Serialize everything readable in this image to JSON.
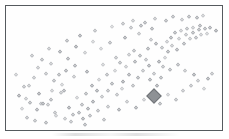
{
  "figure": {
    "title": "",
    "background_color": "#ffffff",
    "frame_color": "#555a5e",
    "marker_color": "#9b9ea3",
    "highlight_marker_color": "#8e9195"
  },
  "chart_data": {
    "type": "scatter",
    "title": "",
    "xlabel": "",
    "ylabel": "",
    "xlim": [
      0,
      100
    ],
    "ylim": [
      0,
      100
    ],
    "grid": false,
    "legend": null,
    "tick_labels": {
      "x": [],
      "y": []
    },
    "annotations": [],
    "series": [
      {
        "name": "observations",
        "marker": "diamond",
        "marker_style": "open",
        "color": "#9b9ea3",
        "points": [
          [
            13.3,
            50.0
          ],
          [
            9.0,
            34.1
          ],
          [
            17.5,
            45.2
          ],
          [
            23.4,
            43.7
          ],
          [
            21.3,
            38.9
          ],
          [
            26.8,
            47.6
          ],
          [
            24.6,
            28.6
          ],
          [
            31.2,
            51.6
          ],
          [
            7.8,
            23.0
          ],
          [
            14.7,
            19.0
          ],
          [
            16.0,
            19.0
          ],
          [
            18.4,
            18.3
          ],
          [
            19.5,
            22.2
          ],
          [
            12.9,
            13.5
          ],
          [
            25.9,
            30.2
          ],
          [
            28.6,
            15.9
          ],
          [
            32.1,
            23.8
          ],
          [
            34.4,
            18.3
          ],
          [
            22.3,
            8.7
          ],
          [
            26.4,
            6.3
          ],
          [
            30.2,
            9.5
          ],
          [
            33.1,
            11.1
          ],
          [
            35.2,
            6.3
          ],
          [
            37.6,
            14.3
          ],
          [
            40.1,
            20.6
          ],
          [
            36.4,
            27.8
          ],
          [
            39.2,
            34.9
          ],
          [
            41.7,
            30.2
          ],
          [
            44.3,
            25.4
          ],
          [
            43.0,
            39.7
          ],
          [
            46.5,
            44.4
          ],
          [
            49.1,
            36.5
          ],
          [
            47.3,
            30.2
          ],
          [
            51.2,
            27.0
          ],
          [
            53.8,
            31.7
          ],
          [
            50.4,
            47.6
          ],
          [
            52.9,
            54.0
          ],
          [
            55.6,
            50.8
          ],
          [
            57.4,
            43.7
          ],
          [
            54.5,
            38.1
          ],
          [
            58.9,
            34.1
          ],
          [
            61.3,
            41.3
          ],
          [
            63.8,
            47.6
          ],
          [
            60.1,
            55.6
          ],
          [
            62.5,
            60.3
          ],
          [
            65.2,
            57.1
          ],
          [
            59.5,
            64.3
          ],
          [
            57.0,
            61.1
          ],
          [
            66.8,
            51.6
          ],
          [
            69.4,
            45.2
          ],
          [
            67.1,
            39.7
          ],
          [
            70.6,
            34.9
          ],
          [
            72.8,
            41.3
          ],
          [
            71.4,
            54.8
          ],
          [
            74.3,
            58.7
          ],
          [
            76.1,
            63.5
          ],
          [
            73.2,
            67.5
          ],
          [
            70.2,
            70.6
          ],
          [
            67.9,
            73.8
          ],
          [
            75.4,
            72.2
          ],
          [
            78.0,
            69.0
          ],
          [
            80.3,
            65.1
          ],
          [
            77.6,
            76.2
          ],
          [
            81.1,
            74.6
          ],
          [
            83.5,
            70.6
          ],
          [
            79.1,
            80.2
          ],
          [
            82.3,
            81.7
          ],
          [
            84.8,
            78.6
          ],
          [
            86.4,
            74.6
          ],
          [
            85.1,
            83.3
          ],
          [
            87.9,
            80.2
          ],
          [
            89.3,
            76.2
          ],
          [
            88.1,
            84.9
          ],
          [
            90.7,
            82.5
          ],
          [
            92.0,
            78.6
          ],
          [
            91.2,
            86.5
          ],
          [
            93.6,
            83.3
          ],
          [
            94.9,
            79.4
          ],
          [
            96.2,
            84.1
          ],
          [
            98.8,
            81.7
          ],
          [
            5.9,
            14.3
          ],
          [
            4.1,
            26.2
          ],
          [
            6.8,
            33.3
          ],
          [
            11.5,
            41.3
          ],
          [
            19.9,
            53.2
          ],
          [
            28.1,
            57.9
          ],
          [
            35.9,
            62.7
          ],
          [
            43.6,
            66.7
          ],
          [
            48.2,
            71.4
          ],
          [
            55.1,
            76.2
          ],
          [
            61.9,
            79.4
          ],
          [
            68.5,
            83.3
          ],
          [
            8.4,
            7.1
          ],
          [
            12.1,
            4.0
          ],
          [
            17.2,
            2.4
          ],
          [
            21.8,
            11.1
          ],
          [
            29.4,
            3.2
          ],
          [
            38.5,
            8.7
          ],
          [
            45.0,
            4.8
          ],
          [
            42.1,
            12.7
          ],
          [
            46.9,
            16.7
          ],
          [
            52.2,
            13.5
          ],
          [
            56.3,
            20.6
          ],
          [
            60.8,
            15.9
          ],
          [
            64.4,
            22.2
          ],
          [
            68.1,
            26.2
          ],
          [
            72.0,
            19.0
          ],
          [
            75.9,
            27.0
          ],
          [
            79.8,
            22.2
          ],
          [
            83.1,
            30.2
          ],
          [
            86.9,
            34.1
          ],
          [
            90.2,
            38.9
          ],
          [
            93.1,
            31.7
          ],
          [
            95.4,
            40.5
          ],
          [
            97.1,
            45.2
          ],
          [
            88.6,
            43.7
          ],
          [
            84.2,
            47.6
          ],
          [
            80.7,
            52.4
          ],
          [
            76.8,
            48.4
          ],
          [
            73.6,
            50.8
          ],
          [
            15.4,
            57.1
          ],
          [
            23.9,
            63.5
          ],
          [
            31.7,
            68.3
          ],
          [
            39.8,
            72.2
          ],
          [
            2.9,
            44.4
          ],
          [
            10.6,
            60.3
          ],
          [
            18.9,
            66.7
          ],
          [
            27.2,
            73.0
          ],
          [
            33.8,
            77.8
          ],
          [
            41.0,
            81.7
          ],
          [
            48.9,
            85.7
          ],
          [
            54.2,
            88.1
          ],
          [
            59.1,
            90.5
          ],
          [
            64.9,
            88.9
          ],
          [
            69.8,
            92.1
          ],
          [
            74.9,
            90.5
          ],
          [
            78.4,
            93.7
          ],
          [
            82.9,
            91.3
          ],
          [
            86.1,
            94.4
          ],
          [
            89.9,
            92.9
          ],
          [
            92.8,
            95.2
          ],
          [
            20.4,
            30.2
          ],
          [
            14.1,
            27.8
          ],
          [
            9.6,
            19.8
          ],
          [
            25.1,
            35.7
          ],
          [
            30.8,
            42.1
          ],
          [
            37.1,
            46.8
          ],
          [
            44.8,
            52.4
          ],
          [
            51.0,
            58.7
          ],
          [
            58.2,
            84.1
          ],
          [
            63.1,
            86.5
          ],
          [
            66.2,
            66.7
          ],
          [
            36.0,
            0.8
          ]
        ]
      },
      {
        "name": "highlighted-observation",
        "marker": "diamond",
        "marker_style": "filled",
        "color": "#8e9195",
        "size": 3.2,
        "points": [
          [
            69.0,
            26.2
          ]
        ]
      }
    ]
  }
}
